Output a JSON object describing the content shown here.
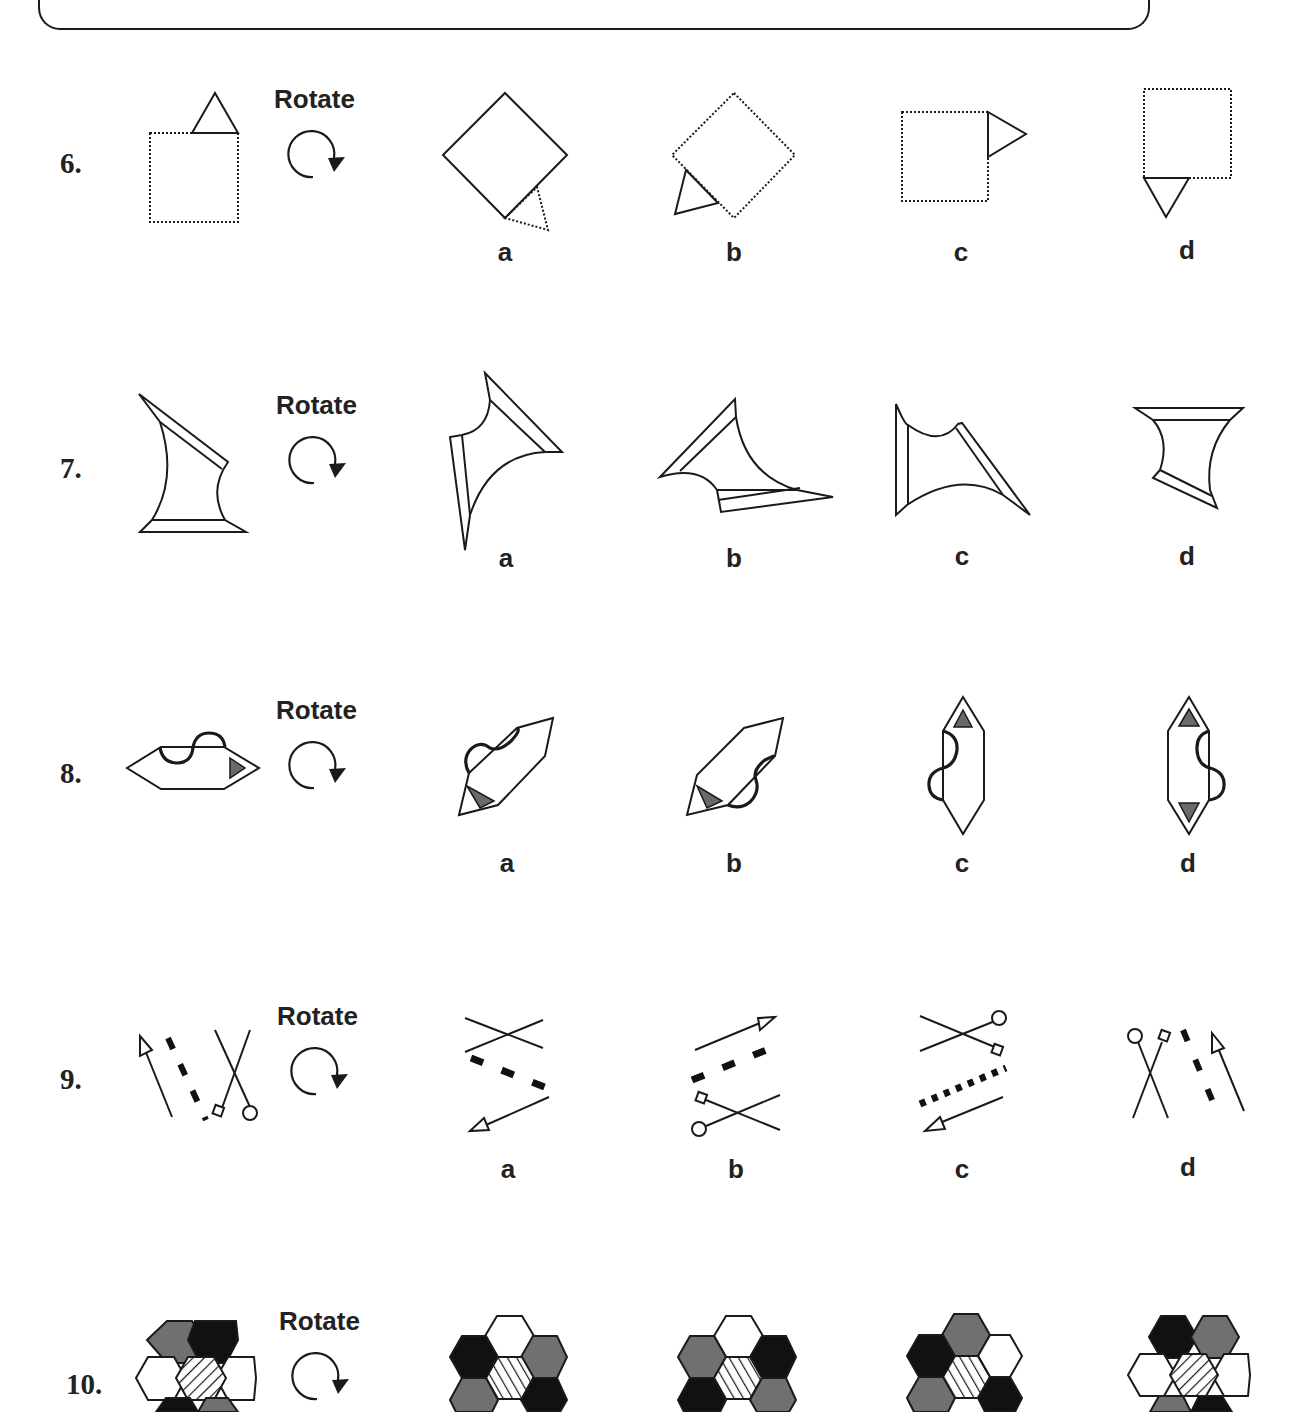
{
  "page": {
    "type": "Spatial reasoning worksheet - rotation questions"
  },
  "rotate_label": "Rotate",
  "rotate_icon": "clockwise-rotate-arrow-icon",
  "colors": {
    "stroke": "#1a1a1a",
    "dark_fill": "#111111",
    "gray_fill": "#707070",
    "triangle_fill": "#6a6a6a",
    "white": "#ffffff"
  },
  "questions": [
    {
      "number": "6.",
      "description": "Dotted square with solid triangle on top-right edge",
      "options": [
        {
          "label": "a",
          "description": "Solid diamond with dotted triangle at bottom-right"
        },
        {
          "label": "b",
          "description": "Dotted diamond with solid triangle at bottom-left"
        },
        {
          "label": "c",
          "description": "Dotted square with solid triangle on right side pointing right"
        },
        {
          "label": "d",
          "description": "Dotted square with solid triangle below pointing down"
        }
      ]
    },
    {
      "number": "7.",
      "description": "Concave axe-head shape with double-line edges",
      "options": [
        {
          "label": "a",
          "description": "Rotated concave shape, double edges top-right and left"
        },
        {
          "label": "b",
          "description": "Rotated concave shape, double edges top-left and bottom"
        },
        {
          "label": "c",
          "description": "Rotated concave shape, double edges left and right diagonal"
        },
        {
          "label": "d",
          "description": "Rotated concave shape, double edges top and lower-left"
        }
      ]
    },
    {
      "number": "8.",
      "description": "Hexagon with S-curve on top edge and gray triangle at right point",
      "options": [
        {
          "label": "a",
          "description": "Diagonal hexagon, curve top-left, triangle bottom-left"
        },
        {
          "label": "b",
          "description": "Diagonal hexagon, curve bottom-right, triangle bottom-left"
        },
        {
          "label": "c",
          "description": "Vertical hexagon, curve on left, triangle at top"
        },
        {
          "label": "d",
          "description": "Vertical hexagon, curve on right, triangles top and bottom"
        }
      ]
    },
    {
      "number": "9.",
      "description": "Arrow, dashed line, and crossed lines with square and circle ends",
      "options": [
        {
          "label": "a",
          "description": "Horizontal cross, dashed line, arrow pointing bottom-left"
        },
        {
          "label": "b",
          "description": "Arrow pointing top-right, dashed line, cross with square and circle"
        },
        {
          "label": "c",
          "description": "Cross with circle and square, dotted line, arrow pointing left"
        },
        {
          "label": "d",
          "description": "Cross with circle and square, dashed line, arrow pointing up"
        }
      ]
    },
    {
      "number": "10.",
      "description": "Hexagon cluster with hatched center",
      "options": [
        {
          "label": "a",
          "description": "Hexagon cluster: white top, black/gray left, gray/black right"
        },
        {
          "label": "b",
          "description": "Hexagon cluster: white top, gray/black left, black/gray right"
        },
        {
          "label": "c",
          "description": "Hexagon cluster: gray top, black left, white right"
        },
        {
          "label": "d",
          "description": "Hexagon cluster: black/gray top, white sides"
        }
      ]
    }
  ]
}
